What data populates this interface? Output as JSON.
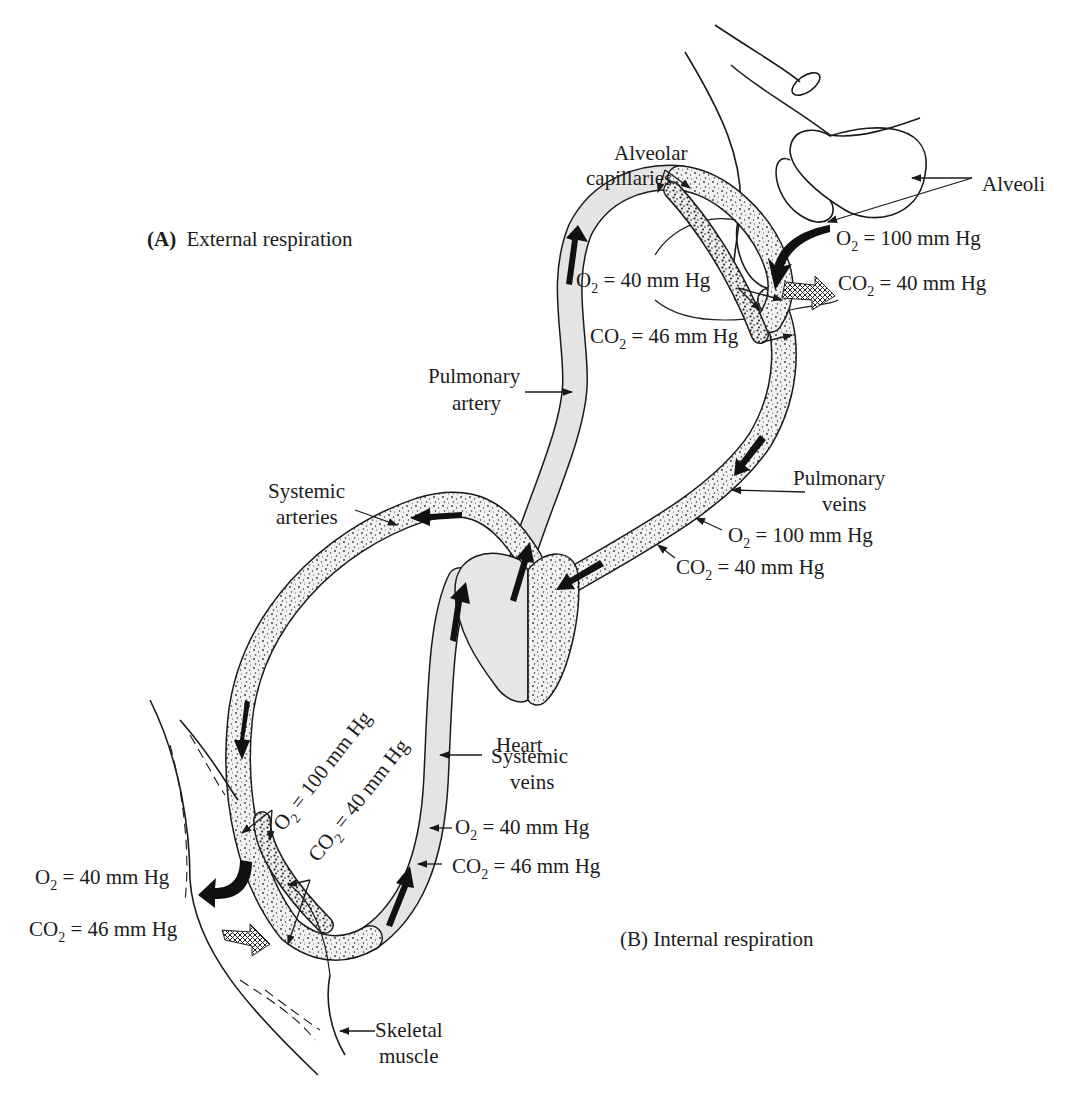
{
  "figure": {
    "sections": {
      "external": {
        "label_prefix": "(A)",
        "label_text": "External respiration"
      },
      "internal": {
        "label": "(B) Internal respiration"
      }
    },
    "labels": {
      "alveolar_capillaries_line1": "Alveolar",
      "alveolar_capillaries_line2": "capillaries",
      "alveoli": "Alveoli",
      "pulmonary_artery_line1": "Pulmonary",
      "pulmonary_artery_line2": "artery",
      "pulmonary_veins_line1": "Pulmonary",
      "pulmonary_veins_line2": "veins",
      "systemic_arteries_line1": "Systemic",
      "systemic_arteries_line2": "arteries",
      "systemic_veins_line1": "Systemic",
      "systemic_veins_line2": "veins",
      "heart": "Heart",
      "skeletal_muscle_line1": "Skeletal",
      "skeletal_muscle_line2": "muscle"
    },
    "gas_values": {
      "alveoli_o2": {
        "gas": "O",
        "subscript": "2",
        "value": " = 100 mm Hg"
      },
      "alveoli_co2": {
        "gas": "CO",
        "subscript": "2",
        "value": " = 40 mm Hg"
      },
      "pulmonary_artery_o2": {
        "gas": "O",
        "subscript": "2",
        "value": " = 40 mm Hg"
      },
      "pulmonary_artery_co2": {
        "gas": "CO",
        "subscript": "2",
        "value": " = 46 mm Hg"
      },
      "pulmonary_veins_o2": {
        "gas": "O",
        "subscript": "2",
        "value": " = 100 mm Hg"
      },
      "pulmonary_veins_co2": {
        "gas": "CO",
        "subscript": "2",
        "value": " = 40 mm Hg"
      },
      "systemic_arteries_o2": {
        "gas": "O",
        "subscript": "2",
        "value": " = 100 mm Hg"
      },
      "systemic_arteries_co2": {
        "gas": "CO",
        "subscript": "2",
        "value": " = 40 mm Hg"
      },
      "systemic_veins_o2": {
        "gas": "O",
        "subscript": "2",
        "value": " = 40 mm Hg"
      },
      "systemic_veins_co2": {
        "gas": "CO",
        "subscript": "2",
        "value": " = 46 mm Hg"
      },
      "tissue_o2": {
        "gas": "O",
        "subscript": "2",
        "value": " = 40 mm Hg"
      },
      "tissue_co2": {
        "gas": "CO",
        "subscript": "2",
        "value": " = 46 mm Hg"
      }
    },
    "colors": {
      "ink": "#1a1a1a",
      "deoxygenated_vessel": "#e4e4e4",
      "oxygenated_vessel_stipple": "#3a3a3a",
      "background": "#ffffff"
    }
  }
}
